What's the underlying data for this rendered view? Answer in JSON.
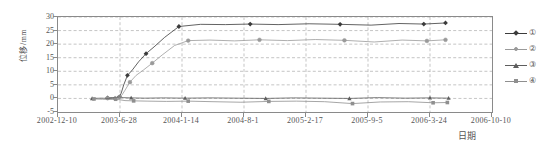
{
  "chart_data": {
    "type": "line",
    "title": "",
    "xlabel": "日期",
    "ylabel": "位移/mm",
    "ylim": [
      -5,
      30
    ],
    "yticks": [
      -5,
      0,
      5,
      10,
      15,
      20,
      25,
      30
    ],
    "ytick_labels": [
      "-5",
      "0",
      "5",
      "10",
      "15",
      "20",
      "25",
      "30"
    ],
    "xtick_labels": [
      "2002-12-10",
      "2003-6-28",
      "2004-1-14",
      "2004-8-1",
      "2005-2-17",
      "2005-9-5",
      "2006-3-24",
      "2006-10-10"
    ],
    "xtick_positions": [
      0,
      1,
      2,
      3,
      4,
      5,
      6,
      7
    ],
    "xlim": [
      0,
      7
    ],
    "grid": true,
    "grid_style": "dashed",
    "legend_position": "right-outside",
    "legend": [
      "①",
      "②",
      "③",
      "④"
    ],
    "series": [
      {
        "name": "①",
        "marker": "diamond",
        "color": "#3b3b3b",
        "x": [
          0.8,
          0.88,
          0.94,
          0.99,
          1.02,
          1.06,
          1.12,
          1.2,
          1.3,
          1.42,
          1.55,
          1.72,
          1.95,
          2.3,
          2.7,
          3.1,
          3.55,
          4.05,
          4.55,
          5.05,
          5.5,
          5.9,
          6.25
        ],
        "y": [
          0.2,
          0.3,
          0.4,
          0.6,
          2.0,
          5.0,
          8.5,
          10.5,
          13.5,
          16.5,
          19.0,
          22.5,
          26.5,
          27.3,
          27.2,
          27.4,
          27.2,
          27.5,
          27.3,
          27.0,
          27.6,
          27.4,
          27.8
        ]
      },
      {
        "name": "②",
        "marker": "circle",
        "color": "#9a9a9a",
        "x": [
          0.8,
          0.88,
          0.94,
          0.99,
          1.03,
          1.08,
          1.16,
          1.26,
          1.38,
          1.52,
          1.68,
          1.88,
          2.1,
          2.45,
          2.85,
          3.25,
          3.7,
          4.15,
          4.62,
          5.1,
          5.55,
          5.95,
          6.25
        ],
        "y": [
          0.1,
          0.2,
          0.3,
          0.5,
          1.2,
          3.0,
          6.0,
          8.5,
          10.5,
          13.0,
          16.0,
          19.5,
          21.3,
          21.5,
          21.2,
          21.6,
          21.3,
          21.7,
          21.4,
          20.8,
          21.5,
          21.2,
          21.6
        ]
      },
      {
        "name": "③",
        "marker": "triangle",
        "color": "#5e5e5e",
        "x": [
          0.55,
          0.7,
          0.82,
          0.92,
          0.99,
          1.05,
          1.18,
          1.4,
          1.7,
          2.05,
          2.45,
          2.9,
          3.35,
          3.8,
          4.25,
          4.7,
          5.15,
          5.6,
          6.0,
          6.3
        ],
        "y": [
          0.0,
          0.1,
          0.0,
          0.2,
          0.6,
          0.3,
          0.2,
          0.1,
          0.2,
          0.1,
          0.2,
          0.1,
          0.0,
          0.2,
          0.1,
          0.0,
          0.3,
          0.1,
          0.2,
          0.1
        ]
      },
      {
        "name": "④",
        "marker": "square",
        "color": "#8f8f8f",
        "x": [
          0.58,
          0.72,
          0.84,
          0.93,
          1.0,
          1.08,
          1.22,
          1.45,
          1.75,
          2.1,
          2.5,
          2.95,
          3.4,
          3.85,
          4.3,
          4.75,
          5.2,
          5.65,
          6.05,
          6.28
        ],
        "y": [
          -0.2,
          -0.3,
          -0.4,
          -0.3,
          -0.5,
          -0.8,
          -0.9,
          -1.0,
          -1.1,
          -1.0,
          -1.2,
          -1.4,
          -1.1,
          -1.0,
          -1.2,
          -1.9,
          -1.3,
          -1.2,
          -1.6,
          -1.5
        ]
      }
    ]
  },
  "axes": {
    "y_title": "位移/mm",
    "x_title": "日期"
  },
  "colors": {
    "frame": "#8a8a8a",
    "grid": "#9e9e9e",
    "text": "#555555",
    "series1": "#3b3b3b",
    "series2": "#9a9a9a",
    "series3": "#5e5e5e",
    "series4": "#8f8f8f"
  }
}
